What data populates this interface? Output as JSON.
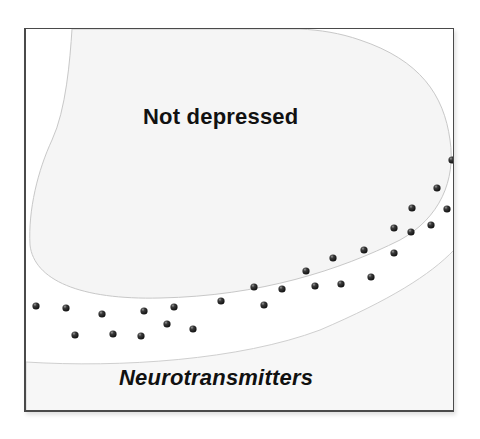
{
  "diagram": {
    "labels": {
      "upper_region": "Not depressed",
      "lower_region": "Neurotransmitters"
    },
    "colors": {
      "frame_border": "#4a4a4a",
      "region_fill": "#f6f6f6",
      "region_outline": "#c8c8c8",
      "dot": "#2a2a2a"
    },
    "dots": [
      [
        36,
        306
      ],
      [
        66,
        308
      ],
      [
        102,
        314
      ],
      [
        144,
        311
      ],
      [
        174,
        307
      ],
      [
        221,
        301
      ],
      [
        75,
        335
      ],
      [
        113,
        334
      ],
      [
        141,
        336
      ],
      [
        167,
        324
      ],
      [
        193,
        329
      ],
      [
        254,
        287
      ],
      [
        282,
        289
      ],
      [
        264,
        305
      ],
      [
        306,
        271
      ],
      [
        315,
        286
      ],
      [
        333,
        258
      ],
      [
        341,
        284
      ],
      [
        364,
        250
      ],
      [
        371,
        277
      ],
      [
        394,
        253
      ],
      [
        394,
        228
      ],
      [
        411,
        232
      ],
      [
        431,
        225
      ],
      [
        412,
        208
      ],
      [
        447,
        209
      ],
      [
        437,
        188
      ],
      [
        452,
        160
      ]
    ]
  }
}
